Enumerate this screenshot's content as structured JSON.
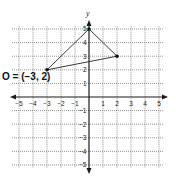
{
  "diagram": {
    "type": "coordinate-plane",
    "x_range": [
      -5,
      5
    ],
    "y_range": [
      -5,
      5
    ],
    "grid": true,
    "axis_labels": {
      "x": "x",
      "y": "y"
    },
    "x_ticks": [
      {
        "value": -5,
        "label": "-5"
      },
      {
        "value": -4,
        "label": "-4"
      },
      {
        "value": -3,
        "label": "-3"
      },
      {
        "value": -2,
        "label": "-2"
      },
      {
        "value": -1,
        "label": "-1"
      },
      {
        "value": 1,
        "label": "1"
      },
      {
        "value": 2,
        "label": "2"
      },
      {
        "value": 3,
        "label": "3"
      },
      {
        "value": 4,
        "label": "4"
      },
      {
        "value": 5,
        "label": "5"
      }
    ],
    "y_ticks": [
      {
        "value": 5,
        "label": "5"
      },
      {
        "value": 4,
        "label": "4"
      },
      {
        "value": 3,
        "label": "3"
      },
      {
        "value": 2,
        "label": "2"
      },
      {
        "value": 1,
        "label": "1"
      },
      {
        "value": -1,
        "label": "-1"
      },
      {
        "value": -2,
        "label": "-2"
      },
      {
        "value": -3,
        "label": "-3"
      },
      {
        "value": -4,
        "label": "-4"
      },
      {
        "value": -5,
        "label": "-5"
      }
    ],
    "triangle": {
      "vertices": [
        {
          "x": 0,
          "y": 5
        },
        {
          "x": 2,
          "y": 3
        },
        {
          "x": -3,
          "y": 2
        }
      ]
    },
    "point_label": "O = (−3, 2)",
    "colors": {
      "grid": "#7a7a7a",
      "axis": "#1a1a1a",
      "triangle": "#3a3a3a",
      "point": "#111111"
    }
  }
}
